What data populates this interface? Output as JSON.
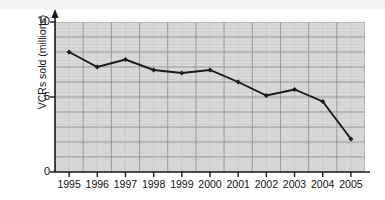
{
  "chart_data": {
    "type": "line",
    "title": "",
    "subtitle": "",
    "xlabel": "",
    "ylabel": "VCRs sold (millions)",
    "categories": [
      "1995",
      "1996",
      "1997",
      "1998",
      "1999",
      "2000",
      "2001",
      "2002",
      "2003",
      "2004",
      "2005"
    ],
    "values": [
      8.0,
      7.0,
      7.5,
      6.8,
      6.6,
      6.8,
      6.0,
      5.1,
      5.5,
      4.7,
      2.2
    ],
    "series": [
      {
        "name": "VCRs sold (millions)",
        "values": [
          8.0,
          7.0,
          7.5,
          6.8,
          6.6,
          6.8,
          6.0,
          5.1,
          5.5,
          4.7,
          2.2
        ]
      }
    ],
    "ylim": [
      0,
      10
    ],
    "yticks": [
      "0",
      "5",
      "10"
    ],
    "ytick_values": [
      0,
      5,
      10
    ],
    "xticks": [
      "1995",
      "1996",
      "1997",
      "1998",
      "1999",
      "2000",
      "2001",
      "2002",
      "2003",
      "2004",
      "2005"
    ],
    "grid": true,
    "grid_minor": true,
    "legend": "none",
    "marker": "diamond",
    "line_color": "#1a1a1a",
    "marker_color": "#1a1a1a",
    "plot_background": "#d9d9d9",
    "grid_major_color": "#8c8c8c",
    "grid_minor_color": "#c6c6c6",
    "axis_color": "#1a1a1a",
    "y_axis_arrow": true
  },
  "axes": {
    "y_title": "VCRs sold (millions)",
    "y_ticks": [
      {
        "label": "10",
        "value": 10
      },
      {
        "label": "5",
        "value": 5
      },
      {
        "label": "0",
        "value": 0
      }
    ],
    "x_ticks": [
      {
        "label": "1995",
        "value": 1995
      },
      {
        "label": "1996",
        "value": 1996
      },
      {
        "label": "1997",
        "value": 1997
      },
      {
        "label": "1998",
        "value": 1998
      },
      {
        "label": "1999",
        "value": 1999
      },
      {
        "label": "2000",
        "value": 2000
      },
      {
        "label": "2001",
        "value": 2001
      },
      {
        "label": "2002",
        "value": 2002
      },
      {
        "label": "2003",
        "value": 2003
      },
      {
        "label": "2004",
        "value": 2004
      },
      {
        "label": "2005",
        "value": 2005
      }
    ]
  }
}
